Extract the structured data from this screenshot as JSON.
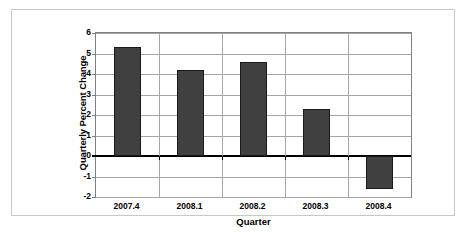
{
  "chart_data": {
    "type": "bar",
    "title": "",
    "subtitle": "",
    "xlabel": "Quarter",
    "ylabel": "Quarterly Percent Change",
    "categories": [
      "2007.4",
      "2008.1",
      "2008.2",
      "2008.3",
      "2008.4"
    ],
    "values": [
      5.3,
      4.2,
      4.6,
      2.3,
      -1.6
    ],
    "series": [
      {
        "name": "Quarterly Percent Change",
        "values": [
          5.3,
          4.2,
          4.6,
          2.3,
          -1.6
        ]
      }
    ],
    "ylim": [
      -2,
      6
    ],
    "yticks": [
      6,
      5,
      4,
      3,
      2,
      1,
      0,
      -1,
      -2
    ],
    "ytick_labels": [
      "6",
      "5",
      "4",
      "3",
      "2",
      "1",
      "0",
      "-1",
      "-2"
    ],
    "grid": true,
    "grid_axis": "both",
    "legend": false,
    "legend_position": "none",
    "bar_color": "#404040",
    "bar_edge_color": "#1a1a1a",
    "gridline_color": "#a6a6a6",
    "zero_line_color": "#000000",
    "plot_border_color": "#808080",
    "frame_border_color": "#c8c8c8",
    "background_color": "#ffffff",
    "annotations": []
  }
}
